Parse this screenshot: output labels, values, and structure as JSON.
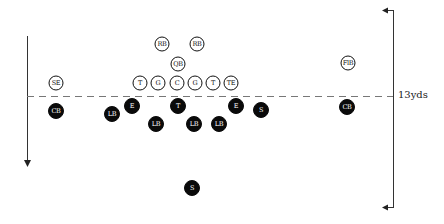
{
  "diagram": {
    "type": "football-formation",
    "line_of_scrimmage": {
      "style": "dashed",
      "y": 96
    },
    "distance_label": "13yds",
    "left_arrow": {
      "direction": "down"
    },
    "right_bracket": {
      "top_arrow": "left",
      "bottom_arrow": "left"
    },
    "offense": [
      {
        "label": "RB",
        "x": 162,
        "y": 44
      },
      {
        "label": "RB",
        "x": 197,
        "y": 44
      },
      {
        "label": "QB",
        "x": 178,
        "y": 64
      },
      {
        "label": "SE",
        "x": 56,
        "y": 83
      },
      {
        "label": "T",
        "x": 140,
        "y": 83
      },
      {
        "label": "G",
        "x": 158,
        "y": 83
      },
      {
        "label": "C",
        "x": 177,
        "y": 83
      },
      {
        "label": "G",
        "x": 195,
        "y": 83
      },
      {
        "label": "T",
        "x": 213,
        "y": 83
      },
      {
        "label": "TE",
        "x": 231,
        "y": 83
      },
      {
        "label": "FlB",
        "x": 348,
        "y": 63
      }
    ],
    "defense": [
      {
        "label": "CB",
        "x": 56,
        "y": 111
      },
      {
        "label": "LB",
        "x": 112,
        "y": 114
      },
      {
        "label": "E",
        "x": 132,
        "y": 106
      },
      {
        "label": "LB",
        "x": 156,
        "y": 124
      },
      {
        "label": "T",
        "x": 178,
        "y": 106
      },
      {
        "label": "LB",
        "x": 194,
        "y": 124
      },
      {
        "label": "LB",
        "x": 219,
        "y": 124
      },
      {
        "label": "E",
        "x": 236,
        "y": 106
      },
      {
        "label": "S",
        "x": 261,
        "y": 110
      },
      {
        "label": "CB",
        "x": 347,
        "y": 107
      },
      {
        "label": "S",
        "x": 192,
        "y": 188
      }
    ]
  }
}
